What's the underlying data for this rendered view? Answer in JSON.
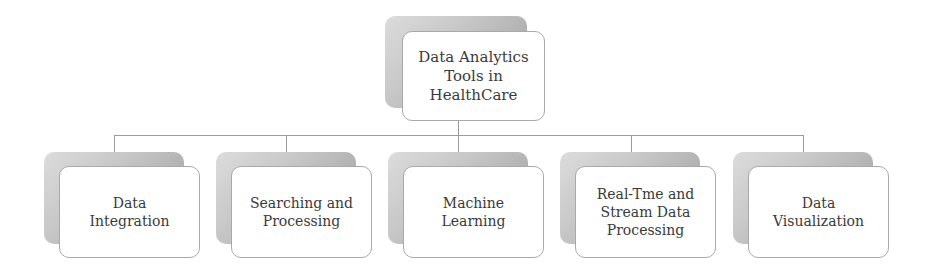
{
  "root": {
    "label": "Data Analytics\nTools in\nHealthCare"
  },
  "children": [
    {
      "label": "Data\nIntegration"
    },
    {
      "label": "Searching and\nProcessing"
    },
    {
      "label": "Machine\nLearning"
    },
    {
      "label": "Real-Tme and\nStream Data\nProcessing"
    },
    {
      "label": "Data\nVisualization"
    }
  ],
  "colors": {
    "border": "#a9a9a9",
    "text": "#3a3a3a",
    "connector": "#9c9c9c"
  }
}
